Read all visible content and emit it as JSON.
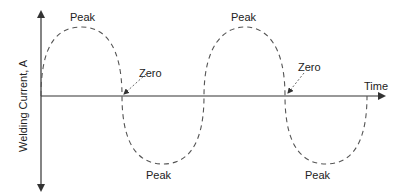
{
  "diagram": {
    "title": "",
    "y_axis_label": "Welding Current, A",
    "x_axis_label": "Time",
    "labels": {
      "peak_1": "Peak",
      "peak_2": "Peak",
      "peak_3": "Peak",
      "peak_4": "Peak",
      "zero_1": "Zero",
      "zero_2": "Zero"
    },
    "waveform": {
      "type": "sine",
      "style": "dashed",
      "cycles": 2,
      "color": "#555555"
    },
    "axis_color": "#333333"
  }
}
